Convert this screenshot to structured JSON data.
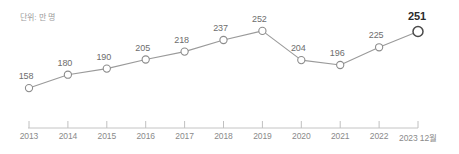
{
  "chart_data": {
    "type": "line",
    "title": "단위: 만 명",
    "xlabel": "",
    "ylabel": "",
    "grid": false,
    "legend": "none",
    "ylim": [
      150,
      260
    ],
    "categories": [
      "2013",
      "2014",
      "2015",
      "2016",
      "2017",
      "2018",
      "2019",
      "2020",
      "2021",
      "2022",
      "2023 12월"
    ],
    "values": [
      158,
      180,
      190,
      205,
      218,
      237,
      252,
      204,
      196,
      225,
      251
    ],
    "point_labels": [
      "158",
      "180",
      "190",
      "205",
      "218",
      "237",
      "252",
      "204",
      "196",
      "225",
      "251"
    ],
    "highlight_index": 10,
    "colors": {
      "line": "#9a9a9a",
      "marker_fill": "#ffffff",
      "marker_stroke": "#8c8c8c",
      "highlight_stroke": "#4a4a4a",
      "label": "#6d6d6d",
      "highlight_label": "#2b2b2b",
      "axis": "#c0c0c0",
      "tick_label": "#8a8a8a",
      "unit_label": "#9b9b9b"
    }
  }
}
